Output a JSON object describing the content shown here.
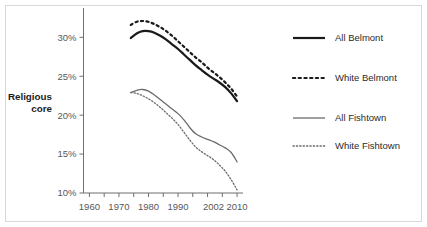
{
  "chart_data": {
    "type": "line",
    "title": "",
    "xlabel": "",
    "ylabel": "Religious core",
    "ylabel_line1": "Religious",
    "ylabel_line2": "core",
    "xlim": [
      1958,
      2012
    ],
    "ylim": [
      10,
      33
    ],
    "grid": false,
    "legend_position": "right",
    "ytick_labels": [
      "10%",
      "15%",
      "20%",
      "25%",
      "30%"
    ],
    "ytick_values": [
      10,
      15,
      20,
      25,
      30
    ],
    "xtick_labels": [
      "1960",
      "1970",
      "1980",
      "1990",
      "2002",
      "2010"
    ],
    "xtick_values": [
      1960,
      1970,
      1980,
      1990,
      2002,
      2010
    ],
    "xtick_minor_values": [
      1960,
      1965,
      1970,
      1975,
      1980,
      1985,
      1990,
      1995,
      2000,
      2005,
      2010
    ],
    "x": [
      1974,
      1976,
      1978,
      1980,
      1982,
      1984,
      1986,
      1988,
      1990,
      1992,
      1994,
      1996,
      1998,
      2000,
      2002,
      2004,
      2006,
      2008,
      2010
    ],
    "series": [
      {
        "name": "All Belmont",
        "style": "solid",
        "color": "#1a1a1a",
        "width": 2.2,
        "values": [
          29.9,
          30.5,
          30.8,
          30.8,
          30.6,
          30.2,
          29.7,
          29.1,
          28.5,
          27.8,
          27.1,
          26.4,
          25.8,
          25.2,
          24.7,
          24.2,
          23.6,
          22.8,
          21.8
        ]
      },
      {
        "name": "White Belmont",
        "style": "dotted",
        "color": "#1a1a1a",
        "width": 2.2,
        "values": [
          31.6,
          32.0,
          32.1,
          32.0,
          31.7,
          31.3,
          30.8,
          30.2,
          29.5,
          28.8,
          28.1,
          27.4,
          26.8,
          26.1,
          25.5,
          24.9,
          24.2,
          23.4,
          22.4
        ]
      },
      {
        "name": "All Fishtown",
        "style": "solid",
        "color": "#6b6b6d",
        "width": 1.3,
        "values": [
          22.9,
          23.2,
          23.3,
          23.1,
          22.6,
          22.0,
          21.4,
          20.8,
          20.2,
          19.4,
          18.4,
          17.6,
          17.2,
          16.9,
          16.6,
          16.2,
          15.8,
          15.2,
          14.0
        ]
      },
      {
        "name": "White Fishtown",
        "style": "dotted",
        "color": "#6b6b6d",
        "width": 1.3,
        "values": [
          22.9,
          22.8,
          22.5,
          22.1,
          21.6,
          21.0,
          20.3,
          19.6,
          18.8,
          17.8,
          16.8,
          15.9,
          15.3,
          14.8,
          14.3,
          13.6,
          12.8,
          11.7,
          10.4
        ]
      }
    ]
  },
  "legend": {
    "items": [
      {
        "label": "All Belmont",
        "swatch": "solid-thick-black"
      },
      {
        "label": "White Belmont",
        "swatch": "dotted-thick-black"
      },
      {
        "label": "All Fishtown",
        "swatch": "solid-thin-gray"
      },
      {
        "label": "White Fishtown",
        "swatch": "dotted-thin-gray"
      }
    ]
  },
  "colors": {
    "belmont": "#1a1a1a",
    "fishtown": "#6b6b6d",
    "axis": "#6f6f71",
    "tick_text": "#58585a",
    "frame_border": "#d8d8d8",
    "background": "#ffffff"
  }
}
